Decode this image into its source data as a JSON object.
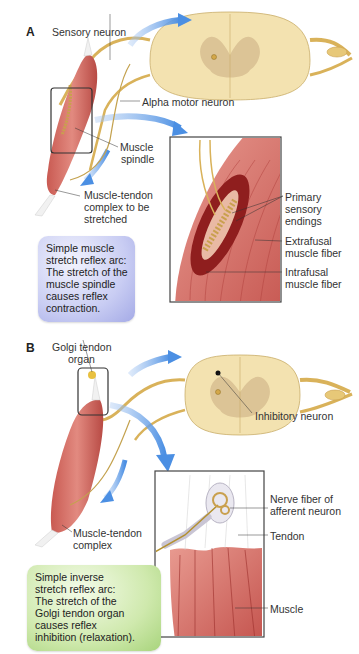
{
  "header": {
    "text": "CHAPTER HEADER (cut off)"
  },
  "panel_a": {
    "letter": "A",
    "labels": {
      "sensory_neuron": "Sensory neuron",
      "alpha_motor_neuron": "Alpha motor neuron",
      "muscle_spindle_1": "Muscle",
      "muscle_spindle_2": "spindle",
      "muscle_tendon_1": "Muscle-tendon",
      "muscle_tendon_2": "complex to be",
      "muscle_tendon_3": "stretched",
      "primary_1": "Primary",
      "primary_2": "sensory",
      "primary_3": "endings",
      "extrafusal_1": "Extrafusal",
      "extrafusal_2": "muscle fiber",
      "intrafusal_1": "Intrafusal",
      "intrafusal_2": "muscle fiber"
    },
    "callout": {
      "color": "#b9beef",
      "lines": [
        "Simple muscle",
        "stretch reflex arc:",
        "The stretch of the",
        "muscle spindle",
        "causes reflex",
        "contraction."
      ]
    }
  },
  "panel_b": {
    "letter": "B",
    "labels": {
      "golgi_1": "Golgi tendon",
      "golgi_2": "organ",
      "inhibitory_neuron": "Inhibitory neuron",
      "muscle_tendon_1": "Muscle-tendon",
      "muscle_tendon_2": "complex",
      "nerve_fiber_1": "Nerve fiber of",
      "nerve_fiber_2": "afferent neuron",
      "tendon": "Tendon",
      "muscle": "Muscle"
    },
    "callout": {
      "color": "#c3e39c",
      "lines": [
        "Simple inverse",
        "stretch reflex arc:",
        "The stretch of the",
        "Golgi tendon organ",
        "causes reflex",
        "inhibition (relaxation)."
      ]
    }
  },
  "colors": {
    "muscle": "#d9746a",
    "muscle_dark": "#b84a44",
    "spinal_cord": "#f3e2b0",
    "gray_matter": "#dcc496",
    "nerve": "#d9b25a",
    "arrow": "#5b9be6"
  }
}
